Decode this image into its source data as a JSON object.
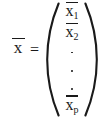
{
  "figure": {
    "kind": "math-equation",
    "text_color": "#1a1a1a",
    "background_color": "#ffffff"
  },
  "equation": {
    "lhs": {
      "symbol": "x",
      "has_overbar": true,
      "rendered": "x̄"
    },
    "relation": "=",
    "rhs": {
      "type": "column-vector",
      "open_delimiter": "(",
      "close_delimiter": ")",
      "entries": [
        {
          "symbol": "x",
          "subscript": "1",
          "has_overbar": true
        },
        {
          "symbol": "x",
          "subscript": "2",
          "has_overbar": true
        },
        {
          "symbol": "x",
          "subscript": "p",
          "has_overbar": true
        }
      ],
      "ellipsis": {
        "style": "vertical-dots",
        "count": 3,
        "glyph": "·"
      }
    }
  }
}
